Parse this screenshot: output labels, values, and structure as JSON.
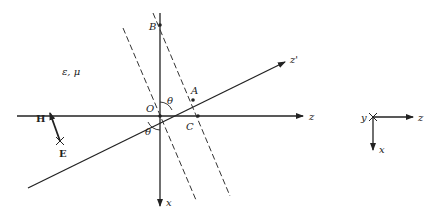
{
  "medium_label": "ε, μ",
  "points": {
    "origin": "O",
    "B": "B",
    "A": "A",
    "C": "C"
  },
  "angles": {
    "upper": "θ",
    "lower": "θ"
  },
  "axes": {
    "z": "z",
    "x": "x",
    "z_prime": "z'"
  },
  "fields": {
    "H": "H",
    "E": "E"
  },
  "reference_axes": {
    "y": "y",
    "z": "z",
    "x": "x"
  },
  "colors": {
    "ink": "#222222",
    "background": "#ffffff"
  }
}
